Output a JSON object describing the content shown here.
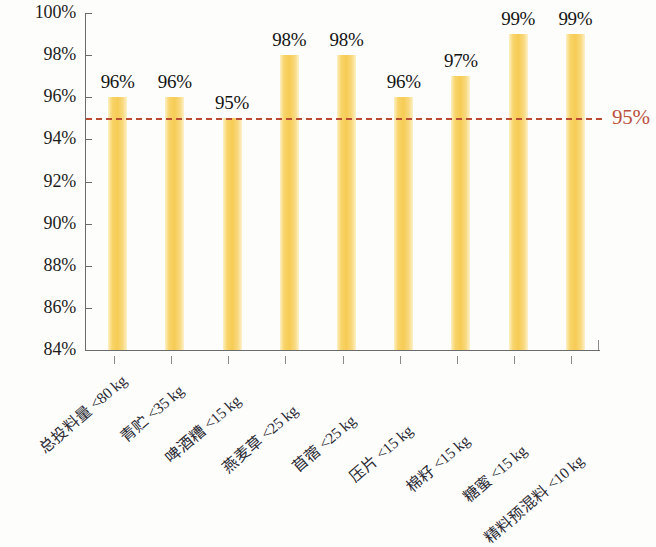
{
  "chart_data": {
    "type": "bar",
    "title": "",
    "subtitle": "",
    "xlabel": "",
    "ylabel": "",
    "ylim": [
      84,
      100
    ],
    "ytick_labels": [
      "100%",
      "98%",
      "96%",
      "94%",
      "92%",
      "90%",
      "88%",
      "86%",
      "84%"
    ],
    "ytick_values": [
      100,
      98,
      96,
      94,
      92,
      90,
      88,
      86,
      84
    ],
    "grid": false,
    "legend": null,
    "categories": [
      "总投料量 <80 kg",
      "青贮 <35 kg",
      "啤酒糟 <15 kg",
      "燕麦草 <25 kg",
      "苜蓿 <25 kg",
      "压片 <15 kg",
      "棉籽 <15 kg",
      "糖蜜 <15 kg",
      "精料预混料 <10 kg"
    ],
    "values": [
      96,
      96,
      95,
      98,
      98,
      96,
      97,
      99,
      99
    ],
    "value_labels": [
      "96%",
      "96%",
      "95%",
      "98%",
      "98%",
      "96%",
      "97%",
      "99%",
      "99%"
    ],
    "reference_line": {
      "value": 95,
      "label": "95%",
      "style": "dashed",
      "color": "#bb4a33"
    },
    "bar_color": "#f8d469",
    "axis_color": "#6b6b6b",
    "label_color": "#141414"
  }
}
